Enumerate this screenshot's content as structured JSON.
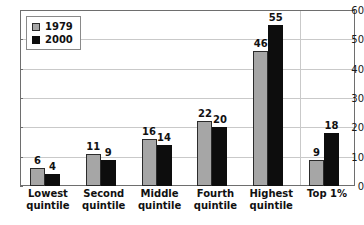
{
  "chart_data": {
    "type": "bar",
    "title": "",
    "xlabel": "",
    "ylabel": "",
    "ylim": [
      0,
      60
    ],
    "yticks": [
      0,
      10,
      20,
      30,
      40,
      50,
      60
    ],
    "grid": true,
    "legend_position": "top-left",
    "categories": [
      "Lowest quintile",
      "Second quintile",
      "Middle quintile",
      "Fourth quintile",
      "Highest quintile",
      "Top 1%"
    ],
    "category_lines": [
      [
        "Lowest",
        "quintile"
      ],
      [
        "Second",
        "quintile"
      ],
      [
        "Middle",
        "quintile"
      ],
      [
        "Fourth",
        "quintile"
      ],
      [
        "Highest",
        "quintile"
      ],
      [
        "Top 1%",
        ""
      ]
    ],
    "series": [
      {
        "name": "1979",
        "color": "#a6a6a6",
        "values": [
          6,
          11,
          16,
          22,
          46,
          9
        ]
      },
      {
        "name": "2000",
        "color": "#0d0d0d",
        "values": [
          4,
          9,
          14,
          20,
          55,
          18
        ]
      }
    ],
    "annotations": {
      "separator_before_category_index": 5
    }
  },
  "title_strip": {
    "text": ""
  },
  "legend": {
    "entries": [
      {
        "label": "1979",
        "swatch": "gray"
      },
      {
        "label": "2000",
        "swatch": "black"
      }
    ]
  },
  "axis": {
    "y_tick_labels": [
      "60",
      "50",
      "40",
      "30",
      "20",
      "10",
      "0"
    ]
  }
}
